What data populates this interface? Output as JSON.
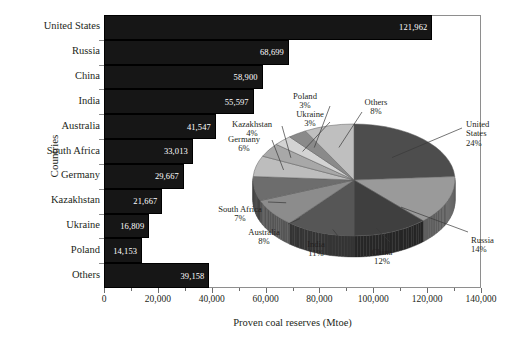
{
  "chart_data": {
    "type": "bar",
    "title": "",
    "xlabel": "Proven coal reserves (Mtoe)",
    "ylabel": "Countries",
    "xlim": [
      0,
      140000
    ],
    "xticks": [
      "0",
      "20,000",
      "40,000",
      "60,000",
      "80,000",
      "100,000",
      "120,000",
      "140,000"
    ],
    "xtick_values": [
      0,
      20000,
      40000,
      60000,
      80000,
      100000,
      120000,
      140000
    ],
    "grid": false,
    "legend": "none",
    "categories": [
      "United States",
      "Russia",
      "China",
      "India",
      "Australia",
      "South Africa",
      "Germany",
      "Kazakhstan",
      "Ukraine",
      "Poland",
      "Others"
    ],
    "values": [
      121962,
      68699,
      58900,
      55597,
      41547,
      33013,
      29667,
      21667,
      16809,
      14153,
      39158
    ],
    "value_labels": [
      "121,962",
      "68,699",
      "58,900",
      "55,597",
      "41,547",
      "33,013",
      "29,667",
      "21,667",
      "16,809",
      "14,153",
      "39,158"
    ],
    "bar_color": "#161616",
    "inset": {
      "type": "pie",
      "style": "3d",
      "labels": [
        "United States",
        "Russia",
        "China",
        "India",
        "Australia",
        "South Africa",
        "Germany",
        "Kazakhstan",
        "Ukraine",
        "Poland",
        "Others"
      ],
      "values": [
        24,
        14,
        12,
        11,
        8,
        7,
        6,
        4,
        3,
        3,
        8
      ],
      "percent_labels": [
        "24%",
        "14%",
        "12%",
        "11%",
        "8%",
        "7%",
        "6%",
        "4%",
        "3%",
        "3%",
        "8%"
      ],
      "slice_colors": [
        "#4d4d4d",
        "#9a9a9a",
        "#3f3f3f",
        "#565656",
        "#8c8c8c",
        "#6d6d6d",
        "#bdbdbd",
        "#a8a8a8",
        "#d3d3d3",
        "#8a8a8a",
        "#bfbfbf"
      ]
    }
  },
  "axes": {
    "ylabel": "Countries",
    "xlabel": "Proven coal reserves (Mtoe)"
  }
}
